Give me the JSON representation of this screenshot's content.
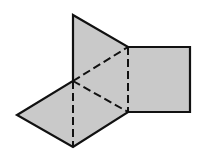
{
  "diagram": {
    "type": "geometric-net",
    "width": 205,
    "height": 156,
    "colors": {
      "fill": "#c9c9c9",
      "stroke": "#111111",
      "background": "#ffffff"
    },
    "vertices": {
      "top": [
        73,
        15
      ],
      "upper_right_join": [
        128,
        47
      ],
      "square_top_right": [
        190,
        47
      ],
      "square_bottom_right": [
        190,
        112
      ],
      "lower_right_join": [
        128,
        112
      ],
      "bottom": [
        73,
        147
      ],
      "left": [
        17,
        115
      ],
      "center": [
        73,
        81
      ]
    },
    "outline": [
      "top",
      "upper_right_join",
      "square_top_right",
      "square_bottom_right",
      "lower_right_join",
      "bottom",
      "left",
      "center",
      "top"
    ],
    "dashed_fold_lines": [
      [
        "center",
        "upper_right_join"
      ],
      [
        "upper_right_join",
        "lower_right_join"
      ],
      [
        "center",
        "lower_right_join"
      ],
      [
        "center",
        "bottom"
      ]
    ],
    "faces": [
      {
        "name": "top-triangle",
        "points": [
          "top",
          "upper_right_join",
          "center"
        ]
      },
      {
        "name": "square",
        "points": [
          "upper_right_join",
          "square_top_right",
          "square_bottom_right",
          "lower_right_join"
        ]
      },
      {
        "name": "middle-triangle",
        "points": [
          "center",
          "upper_right_join",
          "lower_right_join"
        ]
      },
      {
        "name": "lower-left-triangle",
        "points": [
          "center",
          "left",
          "bottom"
        ]
      },
      {
        "name": "lower-right-triangle",
        "points": [
          "center",
          "bottom",
          "lower_right_join"
        ]
      }
    ]
  }
}
